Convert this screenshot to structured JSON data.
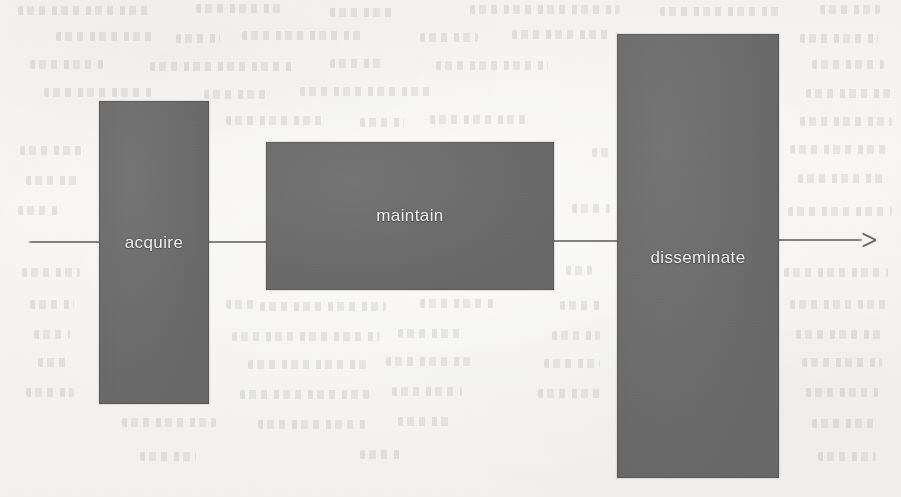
{
  "figure": {
    "kind": "process-flow-diagram",
    "orientation": "horizontal",
    "background_color": "#f5f4f2",
    "box_fill_color": "#6d6d6d",
    "label_color": "#f2f1ef",
    "line_color": "#6e6c6a",
    "medium": "scanned-page-with-bleed-through"
  },
  "flow": {
    "line_label": "process-flow-axis",
    "arrow_direction": "right",
    "arrow_head_name": "arrow-head-right",
    "start_x": 28,
    "end_x": 877,
    "y": 241
  },
  "stages": [
    {
      "id": "acquire",
      "label": "acquire",
      "x": 99,
      "y": 101,
      "width": 110,
      "height": 303,
      "label_y": 234
    },
    {
      "id": "maintain",
      "label": "maintain",
      "x": 266,
      "y": 142,
      "width": 288,
      "height": 148,
      "label_y": 207
    },
    {
      "id": "disseminate",
      "label": "disseminate",
      "x": 617,
      "y": 34,
      "width": 162,
      "height": 444,
      "label_y": 249
    }
  ],
  "bleed_through": {
    "description": "faint mirrored text showing through from the reverse side of the scanned page",
    "visible": true
  }
}
